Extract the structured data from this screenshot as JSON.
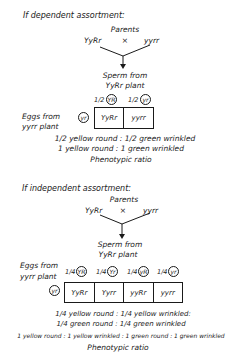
{
  "dependent": {
    "heading": "If dependent assortment:",
    "parents_label": "Parents",
    "cross_symbol": "×",
    "parent1": "YyRr",
    "parent2": "yyrr",
    "sperm_label_1": "Sperm from",
    "sperm_label_2": "YyRr plant",
    "sperm_gametes": [
      {
        "fraction": "1/2",
        "allele": "YR"
      },
      {
        "fraction": "1/2",
        "allele": "yr"
      }
    ],
    "eggs_label_1": "Eggs from",
    "eggs_label_2": "yyrr plant",
    "egg_gamete": "yr",
    "offspring": [
      "YyRr",
      "yyrr"
    ],
    "ratio_line_1": "1/2 yellow round : 1/2 green wrinkled",
    "ratio_line_2": "1 yellow round : 1 green wrinkled",
    "ratio_caption": "Phenotypic ratio"
  },
  "independent": {
    "heading": "If independent assortment:",
    "parents_label": "Parents",
    "cross_symbol": "×",
    "parent1": "YyRr",
    "parent2": "yyrr",
    "sperm_label_1": "Sperm from",
    "sperm_label_2": "YyRr plant",
    "sperm_gametes": [
      {
        "fraction": "1/4",
        "allele": "YR"
      },
      {
        "fraction": "1/4",
        "allele": "Yr"
      },
      {
        "fraction": "1/4",
        "allele": "yR"
      },
      {
        "fraction": "1/4",
        "allele": "yr"
      }
    ],
    "eggs_label_1": "Eggs from",
    "eggs_label_2": "yyrr plant",
    "egg_gamete": "yr",
    "offspring": [
      "YyRr",
      "Yyrr",
      "yyRr",
      "yyrr"
    ],
    "ratio_line_1": "1/4 yellow round : 1/4 yellow wrinkled:",
    "ratio_line_2": "1/4 green round : 1/4 green wrinkled",
    "ratio_line_3": "1 yellow round : 1 yellow wrinkled : 1 green round : 1 green wrinkled",
    "ratio_caption": "Phenotypic ratio"
  }
}
